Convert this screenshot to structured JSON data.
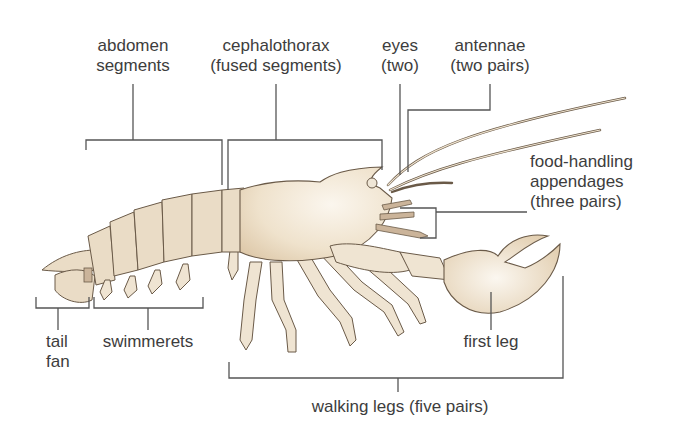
{
  "figure": {
    "colors": {
      "background": "#ffffff",
      "shell_light": "#f6efe3",
      "shell_dark": "#e2cfb2",
      "joint_band": "#cbb49a",
      "leader_line": "#555555",
      "text": "#3d3d3d"
    }
  },
  "labels": {
    "abdomen": {
      "line1": "abdomen",
      "line2": "segments"
    },
    "cephalothorax": {
      "line1": "cephalothorax",
      "line2": "(fused segments)"
    },
    "eyes": {
      "line1": "eyes",
      "line2": "(two)"
    },
    "antennae": {
      "line1": "antennae",
      "line2": "(two pairs)"
    },
    "food_handling": {
      "line1": "food-handling",
      "line2": "appendages",
      "line3": "(three pairs)"
    },
    "tail_fan": {
      "line1": "tail",
      "line2": "fan"
    },
    "swimmerets": {
      "line1": "swimmerets"
    },
    "first_leg": {
      "line1": "first leg"
    },
    "walking_legs": {
      "line1": "walking legs (five pairs)"
    }
  }
}
